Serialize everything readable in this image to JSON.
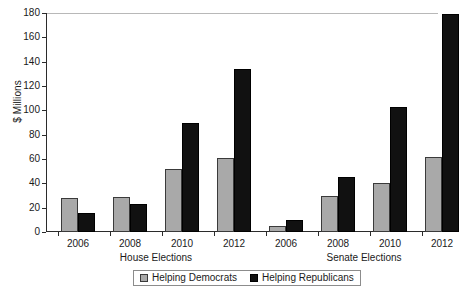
{
  "chart_data": {
    "type": "bar",
    "title": "",
    "subtitle": "",
    "xlabel": "",
    "ylabel": "$ Millions",
    "ylim": [
      0,
      180
    ],
    "yticks": [
      0,
      20,
      40,
      60,
      80,
      100,
      120,
      140,
      160,
      180
    ],
    "grid": false,
    "legend_position": "bottom-center",
    "groups": [
      "House Elections",
      "Senate Elections"
    ],
    "categories": [
      "2006",
      "2008",
      "2010",
      "2012",
      "2006",
      "2008",
      "2010",
      "2012"
    ],
    "series": [
      {
        "name": "Helping Democrats",
        "color": "#a9a9a9",
        "values": [
          28,
          29,
          52,
          61,
          5,
          30,
          40,
          62
        ]
      },
      {
        "name": "Helping Republicans",
        "color": "#111111",
        "values": [
          16,
          23,
          90,
          134,
          10,
          45,
          103,
          179
        ]
      }
    ],
    "group_breakdown": [
      {
        "group": "House Elections",
        "years": [
          "2006",
          "2008",
          "2010",
          "2012"
        ],
        "helping_democrats": [
          28,
          29,
          52,
          61
        ],
        "helping_republicans": [
          16,
          23,
          90,
          134
        ]
      },
      {
        "group": "Senate Elections",
        "years": [
          "2006",
          "2008",
          "2010",
          "2012"
        ],
        "helping_democrats": [
          5,
          30,
          40,
          62
        ],
        "helping_republicans": [
          10,
          45,
          103,
          179
        ]
      }
    ]
  },
  "axis": {
    "y_title": "$ Millions",
    "y_tick_labels": [
      "0",
      "20",
      "40",
      "60",
      "80",
      "100",
      "120",
      "140",
      "160",
      "180"
    ]
  },
  "legend": {
    "items": [
      {
        "label": "Helping Democrats",
        "swatch": "dem"
      },
      {
        "label": "Helping Republicans",
        "swatch": "rep"
      }
    ]
  },
  "x_axis": {
    "group_labels": [
      "House Elections",
      "Senate Elections"
    ],
    "tick_labels": [
      "2006",
      "2008",
      "2010",
      "2012",
      "2006",
      "2008",
      "2010",
      "2012"
    ]
  },
  "colors": {
    "democrats": "#a9a9a9",
    "republicans": "#111111",
    "axis": "#2b2b2b",
    "background": "#ffffff"
  }
}
